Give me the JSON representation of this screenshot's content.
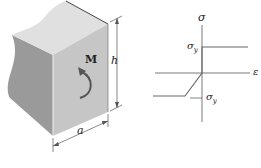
{
  "figure": {
    "block": {
      "moment_label": "M",
      "height_label": "h",
      "width_label": "a"
    },
    "graph": {
      "y_axis_label": "σ",
      "x_axis_label": "ε",
      "upper_yield_label": "σ",
      "upper_yield_subscript": "y",
      "lower_yield_label": "σ",
      "lower_yield_subscript": "y"
    },
    "colors": {
      "face_front": "#c4c4c4",
      "face_left": "#9c9c9c",
      "face_top": "#e2e2e2",
      "line": "#555555"
    }
  }
}
